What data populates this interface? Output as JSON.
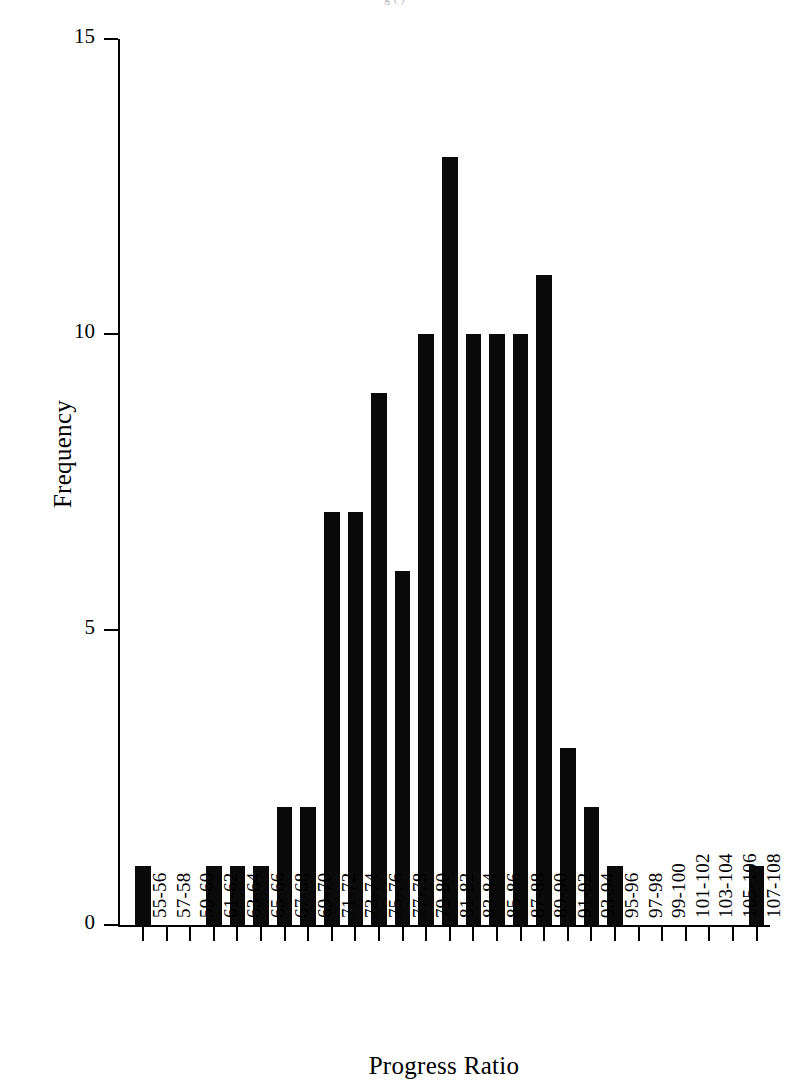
{
  "top_clipped_text": "g ( )",
  "chart_data": {
    "type": "bar",
    "title": "",
    "xlabel": "Progress Ratio",
    "ylabel": "Frequency",
    "categories": [
      "55-56",
      "57-58",
      "59-60",
      "61-62",
      "63-64",
      "65-66",
      "67-68",
      "69-70",
      "71-72",
      "73-74",
      "75-76",
      "77-78",
      "79-80",
      "81-82",
      "83-84",
      "85-86",
      "87-88",
      "89-90",
      "91-92",
      "93-94",
      "95-96",
      "97-98",
      "99-100",
      "101-102",
      "103-104",
      "105-106",
      "107-108"
    ],
    "values": [
      1,
      0,
      0,
      1,
      1,
      1,
      2,
      2,
      7,
      7,
      9,
      6,
      10,
      13,
      10,
      10,
      10,
      11,
      3,
      2,
      1,
      0,
      0,
      0,
      0,
      0,
      1
    ],
    "ylim": [
      0,
      15
    ],
    "yticks": [
      0,
      5,
      10,
      15
    ],
    "ytick_labels": [
      "0",
      "5",
      "10",
      "15"
    ],
    "grid": false,
    "legend": false,
    "bar_color": "#0a0a0a",
    "axis_color": "#000000",
    "background": "#ffffff"
  }
}
